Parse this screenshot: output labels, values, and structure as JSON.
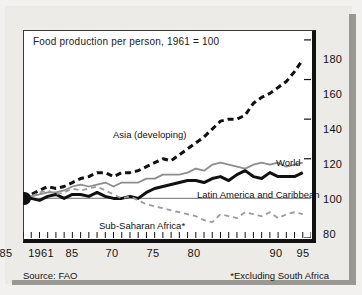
{
  "chart_data": {
    "type": "line",
    "title": "Food production per person, 1961 = 100",
    "xlabel": "",
    "ylabel": "",
    "xlim": [
      1961,
      1996
    ],
    "ylim": [
      80,
      185
    ],
    "yticks": [
      80,
      100,
      120,
      140,
      160,
      180
    ],
    "xticks": [
      1961,
      1965,
      1970,
      1975,
      1980,
      1985,
      1990,
      1995
    ],
    "xtick_labels": [
      "1961",
      "85",
      "70",
      "75",
      "80",
      "85",
      "90",
      "95"
    ],
    "grid": false,
    "baseline": 100,
    "legend_position": "inline-annotations",
    "source": "Source: FAO",
    "footnote": "*Excluding South Africa",
    "origin_marker": {
      "x": 1961,
      "y": 100
    },
    "series": [
      {
        "name": "Asia (developing)",
        "style": "dashed-thick-black",
        "color": "#111111",
        "label": "Asia (developing)",
        "x": [
          1961,
          1962,
          1963,
          1964,
          1965,
          1966,
          1967,
          1968,
          1969,
          1970,
          1971,
          1972,
          1973,
          1974,
          1975,
          1976,
          1977,
          1978,
          1979,
          1980,
          1981,
          1982,
          1983,
          1984,
          1985,
          1986,
          1987,
          1988,
          1989,
          1990,
          1991,
          1992,
          1993,
          1994,
          1995
        ],
        "values": [
          100,
          102,
          104,
          106,
          105,
          106,
          108,
          110,
          111,
          113,
          113,
          111,
          113,
          113,
          114,
          116,
          118,
          120,
          119,
          122,
          125,
          128,
          131,
          135,
          139,
          140,
          140,
          142,
          148,
          151,
          153,
          156,
          159,
          164,
          170
        ]
      },
      {
        "name": "World",
        "style": "solid-thin-gray",
        "color": "#8d8d8d",
        "label": "World",
        "x": [
          1961,
          1962,
          1963,
          1964,
          1965,
          1966,
          1967,
          1968,
          1969,
          1970,
          1971,
          1972,
          1973,
          1974,
          1975,
          1976,
          1977,
          1978,
          1979,
          1980,
          1981,
          1982,
          1983,
          1984,
          1985,
          1986,
          1987,
          1988,
          1989,
          1990,
          1991,
          1992,
          1993,
          1994,
          1995
        ],
        "values": [
          100,
          101,
          102,
          103,
          103,
          104,
          106,
          107,
          106,
          107,
          108,
          106,
          108,
          108,
          108,
          110,
          110,
          112,
          112,
          112,
          113,
          115,
          114,
          117,
          118,
          117,
          116,
          115,
          117,
          118,
          117,
          118,
          116,
          117,
          118
        ]
      },
      {
        "name": "Latin America and Caribbean",
        "style": "solid-thick-black",
        "color": "#111111",
        "label": "Latin America and Caribbean",
        "x": [
          1961,
          1962,
          1963,
          1964,
          1965,
          1966,
          1967,
          1968,
          1969,
          1970,
          1971,
          1972,
          1973,
          1974,
          1975,
          1976,
          1977,
          1978,
          1979,
          1980,
          1981,
          1982,
          1983,
          1984,
          1985,
          1986,
          1987,
          1988,
          1989,
          1990,
          1991,
          1992,
          1993,
          1994,
          1995
        ],
        "values": [
          100,
          100,
          99,
          101,
          102,
          100,
          102,
          102,
          101,
          103,
          101,
          100,
          100,
          101,
          100,
          103,
          105,
          106,
          107,
          108,
          109,
          109,
          108,
          110,
          111,
          109,
          112,
          114,
          111,
          110,
          113,
          111,
          111,
          111,
          113
        ]
      },
      {
        "name": "Sub-Saharan Africa*",
        "style": "dashed-thin-gray",
        "color": "#9b9b9b",
        "label": "Sub-Saharan Africa*",
        "x": [
          1961,
          1962,
          1963,
          1964,
          1965,
          1966,
          1967,
          1968,
          1969,
          1970,
          1971,
          1972,
          1973,
          1974,
          1975,
          1976,
          1977,
          1978,
          1979,
          1980,
          1981,
          1982,
          1983,
          1984,
          1985,
          1986,
          1987,
          1988,
          1989,
          1990,
          1991,
          1992,
          1993,
          1994,
          1995
        ],
        "values": [
          100,
          101,
          103,
          104,
          102,
          103,
          105,
          104,
          105,
          106,
          104,
          102,
          100,
          101,
          99,
          97,
          96,
          95,
          94,
          93,
          92,
          91,
          89,
          88,
          92,
          91,
          90,
          93,
          92,
          91,
          93,
          90,
          92,
          93,
          92
        ]
      }
    ]
  },
  "labels": {
    "asia": "Asia (developing)",
    "world": "World",
    "latam": "Latin America and Caribbean",
    "ssa": "Sub-Saharan Africa*"
  },
  "axis": {
    "y": [
      "180",
      "160",
      "140",
      "120",
      "100",
      "80"
    ],
    "x": [
      "1961",
      "85",
      "70",
      "75",
      "80",
      "85",
      "90",
      "95"
    ]
  }
}
